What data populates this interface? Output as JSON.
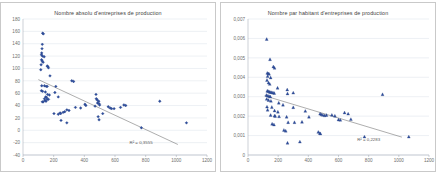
{
  "page": {
    "background": "#ffffff",
    "panel_border_color": "#c9c9c9",
    "marker_color": "#2f4f9e",
    "trendline_color": "#6b6b6b",
    "gridline_color": "#d2d9e3"
  },
  "charts": [
    {
      "id": "chart-absolute",
      "title": "Nombre absolu d'entreprises de production",
      "r2_label": "R² = 0,3555"
    },
    {
      "id": "chart-per-capita",
      "title": "Nombre par habitant d'entreprises de production",
      "r2_label": "R² = 0,2283"
    }
  ],
  "chart_data": [
    {
      "type": "scatter",
      "title": "Nombre absolu d'entreprises de production",
      "xlabel": "",
      "ylabel": "",
      "xlim": [
        0,
        1200
      ],
      "ylim": [
        -40,
        180
      ],
      "xticks": [
        0,
        200,
        400,
        600,
        800,
        1000,
        1200
      ],
      "yticks": [
        -40,
        -20,
        0,
        20,
        40,
        60,
        80,
        100,
        120,
        140,
        160,
        180
      ],
      "grid": "horizontal",
      "legend": "none",
      "marker": "diamond",
      "marker_color": "#2f4f9e",
      "annotations": [
        {
          "text": "R² = 0,3555",
          "x": 770,
          "y": -22
        }
      ],
      "trendline": {
        "type": "linear",
        "x": [
          100,
          1010
        ],
        "y": [
          82,
          -23
        ],
        "r2": 0.3555
      },
      "series": [
        {
          "name": "Entreprises de production (nombre absolu)",
          "points": [
            [
              128,
              157
            ],
            [
              133,
              156
            ],
            [
              126,
              139
            ],
            [
              124,
              132
            ],
            [
              122,
              125
            ],
            [
              120,
              122
            ],
            [
              127,
              120
            ],
            [
              138,
              119
            ],
            [
              121,
              114
            ],
            [
              125,
              112
            ],
            [
              131,
              110
            ],
            [
              118,
              106
            ],
            [
              158,
              104
            ],
            [
              162,
              103
            ],
            [
              166,
              101
            ],
            [
              116,
              98
            ],
            [
              176,
              88
            ],
            [
              122,
              72
            ],
            [
              140,
              72
            ],
            [
              152,
              71
            ],
            [
              158,
              71
            ],
            [
              214,
              71
            ],
            [
              318,
              80
            ],
            [
              330,
              79
            ],
            [
              120,
              64
            ],
            [
              128,
              63
            ],
            [
              146,
              62
            ],
            [
              208,
              61
            ],
            [
              160,
              58
            ],
            [
              172,
              57
            ],
            [
              476,
              58
            ],
            [
              148,
              54
            ],
            [
              154,
              53
            ],
            [
              140,
              51
            ],
            [
              158,
              50
            ],
            [
              166,
              50
            ],
            [
              144,
              48
            ],
            [
              150,
              47
            ],
            [
              126,
              46
            ],
            [
              132,
              46
            ],
            [
              230,
              54
            ],
            [
              478,
              51
            ],
            [
              484,
              49
            ],
            [
              494,
              47
            ],
            [
              486,
              44
            ],
            [
              496,
              43
            ],
            [
              500,
              41
            ],
            [
              470,
              39
            ],
            [
              404,
              42
            ],
            [
              410,
              40
            ],
            [
              376,
              36
            ],
            [
              342,
              37
            ],
            [
              286,
              33
            ],
            [
              300,
              32
            ],
            [
              272,
              30
            ],
            [
              262,
              29
            ],
            [
              202,
              27
            ],
            [
              242,
              28
            ],
            [
              246,
              27
            ],
            [
              230,
              26
            ],
            [
              556,
              38
            ],
            [
              568,
              36
            ],
            [
              578,
              35
            ],
            [
              594,
              35
            ],
            [
              636,
              37
            ],
            [
              658,
              41
            ],
            [
              670,
              40
            ],
            [
              520,
              27
            ],
            [
              490,
              22
            ],
            [
              496,
              17
            ],
            [
              248,
              16
            ],
            [
              286,
              12
            ],
            [
              892,
              47
            ],
            [
              772,
              4
            ],
            [
              1066,
              12
            ]
          ]
        }
      ]
    },
    {
      "type": "scatter",
      "title": "Nombre par habitant d'entreprises de production",
      "xlabel": "",
      "ylabel": "",
      "xlim": [
        0,
        1200
      ],
      "ylim": [
        0,
        0.007
      ],
      "xticks": [
        0,
        200,
        400,
        600,
        800,
        1000,
        1200
      ],
      "yticks": [
        0,
        0.001,
        0.002,
        0.003,
        0.004,
        0.005,
        0.006,
        0.007
      ],
      "ytick_labels": [
        "0",
        "0,001",
        "0,002",
        "0,003",
        "0,004",
        "0,005",
        "0,006",
        "0,007"
      ],
      "grid": "horizontal",
      "legend": "none",
      "marker": "triangle",
      "marker_color": "#2f4f9e",
      "annotations": [
        {
          "text": "R² = 0,2283",
          "x": 800,
          "y": 0.00072
        }
      ],
      "trendline": {
        "type": "linear",
        "x": [
          110,
          1020
        ],
        "y": [
          0.00305,
          0.00092
        ],
        "r2": 0.2283
      },
      "series": [
        {
          "name": "Entreprises de production par habitant",
          "points": [
            [
              124,
              0.00596
            ],
            [
              146,
              0.00492
            ],
            [
              168,
              0.00455
            ],
            [
              176,
              0.00448
            ],
            [
              128,
              0.00422
            ],
            [
              134,
              0.00419
            ],
            [
              140,
              0.00417
            ],
            [
              130,
              0.00405
            ],
            [
              150,
              0.00398
            ],
            [
              126,
              0.00385
            ],
            [
              136,
              0.00372
            ],
            [
              144,
              0.00365
            ],
            [
              196,
              0.00345
            ],
            [
              260,
              0.00336
            ],
            [
              128,
              0.0033
            ],
            [
              134,
              0.00328
            ],
            [
              142,
              0.00325
            ],
            [
              150,
              0.00323
            ],
            [
              158,
              0.00322
            ],
            [
              166,
              0.0032
            ],
            [
              174,
              0.00318
            ],
            [
              262,
              0.00316
            ],
            [
              300,
              0.0032
            ],
            [
              122,
              0.00308
            ],
            [
              132,
              0.00305
            ],
            [
              140,
              0.00302
            ],
            [
              148,
              0.003
            ],
            [
              124,
              0.00288
            ],
            [
              136,
              0.00282
            ],
            [
              152,
              0.00278
            ],
            [
              204,
              0.00268
            ],
            [
              232,
              0.00258
            ],
            [
              126,
              0.00248
            ],
            [
              158,
              0.00246
            ],
            [
              300,
              0.00245
            ],
            [
              130,
              0.00232
            ],
            [
              176,
              0.00228
            ],
            [
              198,
              0.00222
            ],
            [
              380,
              0.00226
            ],
            [
              150,
              0.00205
            ],
            [
              176,
              0.00202
            ],
            [
              180,
              0.002
            ],
            [
              206,
              0.00198
            ],
            [
              256,
              0.00196
            ],
            [
              404,
              0.00196
            ],
            [
              478,
              0.00212
            ],
            [
              486,
              0.00208
            ],
            [
              496,
              0.00206
            ],
            [
              508,
              0.00203
            ],
            [
              520,
              0.00205
            ],
            [
              556,
              0.00206
            ],
            [
              576,
              0.00201
            ],
            [
              640,
              0.00218
            ],
            [
              664,
              0.00212
            ],
            [
              600,
              0.00182
            ],
            [
              612,
              0.0018
            ],
            [
              682,
              0.00184
            ],
            [
              266,
              0.00168
            ],
            [
              308,
              0.00168
            ],
            [
              358,
              0.0017
            ],
            [
              160,
              0.0016
            ],
            [
              172,
              0.00156
            ],
            [
              238,
              0.00128
            ],
            [
              250,
              0.00124
            ],
            [
              466,
              0.00118
            ],
            [
              476,
              0.00112
            ],
            [
              480,
              0.0011
            ],
            [
              262,
              0.00062
            ],
            [
              344,
              0.00068
            ],
            [
              772,
              0.00094
            ],
            [
              892,
              0.00312
            ],
            [
              1066,
              0.00094
            ]
          ]
        }
      ]
    }
  ]
}
